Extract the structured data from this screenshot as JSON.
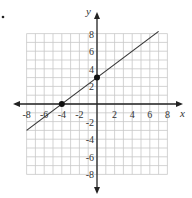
{
  "chart_data": {
    "type": "line",
    "title": "",
    "xlabel": "x",
    "ylabel": "y",
    "xlim": [
      -8,
      8
    ],
    "ylim": [
      -8,
      8
    ],
    "grid": true,
    "x_ticks": [
      "-8",
      "-6",
      "-4",
      "-2",
      "2",
      "4",
      "6",
      "8"
    ],
    "y_ticks": [
      "8",
      "6",
      "4",
      "2",
      "-2",
      "-4",
      "-6",
      "-8"
    ],
    "series": [
      {
        "name": "line",
        "equation": "y = 0.75x + 3",
        "x": [
          -8,
          7
        ],
        "y": [
          -3,
          8.25
        ]
      }
    ],
    "points": [
      {
        "x": -4,
        "y": 0,
        "label": "x-intercept"
      },
      {
        "x": 0,
        "y": 3,
        "label": "y-intercept"
      }
    ],
    "colors": {
      "grid": "#c8c8c8",
      "axis": "#222222",
      "line": "#333333",
      "point": "#111111"
    }
  },
  "axis_labels": {
    "x": "x",
    "y": "y"
  },
  "ticks": {
    "x": [
      {
        "v": -8,
        "t": "-8"
      },
      {
        "v": -6,
        "t": "-6"
      },
      {
        "v": -4,
        "t": "-4"
      },
      {
        "v": -2,
        "t": "-2"
      },
      {
        "v": 2,
        "t": "2"
      },
      {
        "v": 4,
        "t": "4"
      },
      {
        "v": 6,
        "t": "6"
      },
      {
        "v": 8,
        "t": "8"
      }
    ],
    "y": [
      {
        "v": 8,
        "t": "8"
      },
      {
        "v": 6,
        "t": "6"
      },
      {
        "v": 4,
        "t": "4"
      },
      {
        "v": 2,
        "t": "2"
      },
      {
        "v": -2,
        "t": "-2"
      },
      {
        "v": -4,
        "t": "-4"
      },
      {
        "v": -6,
        "t": "-6"
      },
      {
        "v": -8,
        "t": "-8"
      }
    ]
  }
}
